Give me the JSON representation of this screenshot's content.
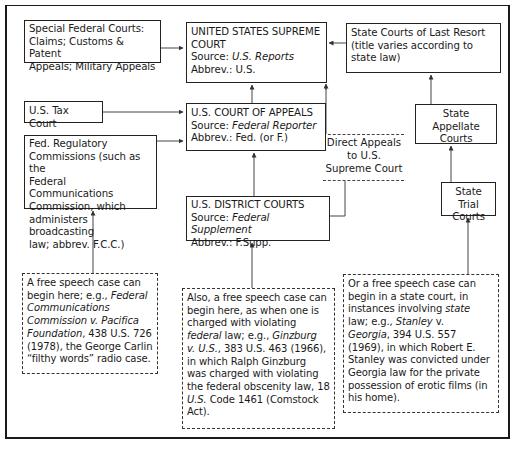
{
  "diagram": {
    "boxes": {
      "special_federal": {
        "lines": [
          "Special Federal Courts:",
          "Claims; Customs & Patent",
          "Appeals; Military Appeals"
        ]
      },
      "supreme_court": {
        "title_1": "UNITED STATES SUPREME",
        "title_2": "COURT",
        "source_label": "Source: ",
        "source_value": "U.S. Reports",
        "abbrev": "Abbrev.: U.S."
      },
      "state_last_resort": {
        "lines": [
          "State Courts of Last Resort",
          "(title varies according to",
          "state law)"
        ]
      },
      "tax_court": {
        "label": "U.S. Tax Court"
      },
      "court_of_appeals": {
        "title": "U.S. COURT OF APPEALS",
        "source_label": "Source: ",
        "source_value": "Federal Reporter",
        "abbrev": "Abbrev.: Fed. (or F.)"
      },
      "fed_regulatory": {
        "lines": [
          "Fed. Regulatory",
          "Commissions (such as the",
          "Federal Communications",
          "Commission, which",
          "administers broadcasting",
          "law; abbrev. F.C.C.)"
        ]
      },
      "direct_appeals": {
        "lines": [
          "Direct Appeals",
          "to U.S.",
          "Supreme Court"
        ]
      },
      "district_courts": {
        "title": "U.S. DISTRICT COURTS",
        "source_label": "Source: ",
        "source_value": "Federal Supplement",
        "abbrev": "Abbrev.: F.Supp."
      },
      "state_appellate": {
        "lines": [
          "State Appellate",
          "Courts"
        ]
      },
      "state_trial": {
        "lines": [
          "State Trial",
          "Courts"
        ]
      }
    },
    "notes": {
      "federal_commission_case": {
        "l1": "A free speech case can",
        "l2a": "begin here; e.g., ",
        "l2b": "Federal",
        "l3": "Communications",
        "l4a": "Commission v. ",
        "l4b": "Pacifica",
        "l5a": "Foundation",
        "l5b": ", 438 U.S. 726",
        "l6": "(1978), the George Carlin",
        "l7": "“filthy words” radio case."
      },
      "federal_district_case": {
        "l1": "Also, a free speech case can",
        "l2": "begin here, as when one is",
        "l3": "charged with violating",
        "l4a": "federal",
        "l4b": " law; e.g., ",
        "l4c": "Ginzburg",
        "l5a": "v. ",
        "l5b": "U.S.",
        "l5c": ", 383 U.S. 463 (1966),",
        "l6": "in which Ralph Ginzburg",
        "l7": "was charged with violating",
        "l8": "the federal obscenity law, 18",
        "l9a": "U.S.",
        "l9b": " Code 1461 (Comstock",
        "l10": "Act)."
      },
      "state_court_case": {
        "l1": "Or a free speech case can",
        "l2": "begin in a state court, in",
        "l3a": "instances involving ",
        "l3b": "state",
        "l4a": "law; e.g., ",
        "l4b": "Stanley",
        "l4c": " v.",
        "l5a": "Georgia",
        "l5b": ", 394 U.S. 557",
        "l6": "(1969), in which Robert E.",
        "l7": "Stanley was convicted under",
        "l8": "Georgia law for the private",
        "l9": "possession of erotic films (in",
        "l10": "his home)."
      }
    }
  }
}
